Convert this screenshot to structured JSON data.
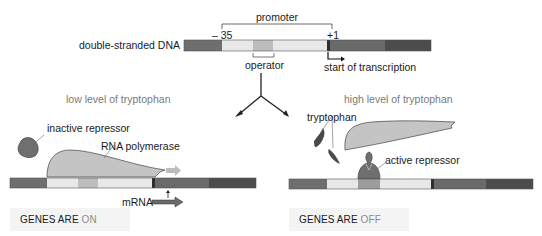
{
  "top": {
    "promoter_label": "promoter",
    "minus35_label": "– 35",
    "plus1_label": "+1",
    "dna_label": "double-stranded DNA",
    "operator_label": "operator",
    "transcription_label": "start of transcription"
  },
  "left_panel": {
    "condition": "low level of tryptophan",
    "inactive_repressor_label": "inactive repressor",
    "rna_polymerase_label": "RNA polymerase",
    "mrna_label": "mRNA",
    "status_prefix": "GENES ARE ",
    "status_state": "ON"
  },
  "right_panel": {
    "condition": "high level of tryptophan",
    "tryptophan_label": "tryptophan",
    "active_repressor_label": "active repressor",
    "status_prefix": "GENES ARE ",
    "status_state": "OFF"
  },
  "colors": {
    "dna_dark_left": "#6e6e6e",
    "dna_promoter": "#e8e8e8",
    "dna_operator": "#bdbdbd",
    "dna_gene": "#6a6a6a",
    "dna_gene_end": "#4c4c4c",
    "polymerase": "#c4c4c4",
    "repressor": "#6f6f6f",
    "tryptophan": "#4a4a4a",
    "status_bg": "#f4f4f4"
  }
}
